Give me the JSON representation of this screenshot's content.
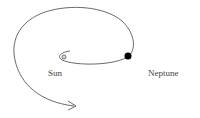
{
  "diagram": {
    "type": "orbital spiral",
    "labels": {
      "sun": "Sun",
      "neptune": "Neptune"
    },
    "colors": {
      "stroke": "#444444",
      "planet": "#000000",
      "background": "#ffffff"
    }
  }
}
